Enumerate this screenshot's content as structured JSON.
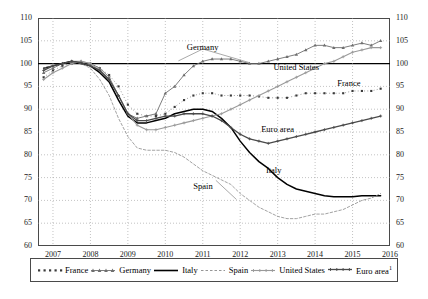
{
  "chart_data": {
    "type": "line",
    "title": "",
    "xlabel": "",
    "ylabel": "",
    "xlim": [
      2006.6,
      2016.0
    ],
    "ylim": [
      60,
      110
    ],
    "y_ticks": [
      60,
      65,
      70,
      75,
      80,
      85,
      90,
      95,
      100,
      105,
      110
    ],
    "x_ticks": [
      "2007",
      "2008",
      "2009",
      "2010",
      "2011",
      "2012",
      "2013",
      "2014",
      "2015",
      "2016"
    ],
    "grid": true,
    "legend_position": "bottom",
    "reference_line": 100,
    "series": [
      {
        "name": "France",
        "style": "dotted-markers",
        "x": [
          2006.75,
          2007.0,
          2007.25,
          2007.5,
          2007.75,
          2008.0,
          2008.25,
          2008.5,
          2008.75,
          2009.0,
          2009.25,
          2009.5,
          2009.75,
          2010.0,
          2010.25,
          2010.5,
          2010.75,
          2011.0,
          2011.25,
          2011.5,
          2011.75,
          2012.0,
          2012.25,
          2012.5,
          2012.75,
          2013.0,
          2013.25,
          2013.5,
          2013.75,
          2014.0,
          2014.25,
          2014.5,
          2014.75,
          2015.0,
          2015.25,
          2015.5,
          2015.75
        ],
        "values": [
          97.0,
          98.5,
          99.5,
          100.0,
          100.2,
          100.0,
          99.0,
          97.5,
          95.0,
          91.0,
          89.0,
          88.5,
          88.5,
          89.0,
          90.5,
          92.0,
          93.0,
          93.5,
          93.5,
          93.0,
          93.0,
          93.0,
          93.0,
          92.8,
          92.5,
          92.5,
          92.5,
          93.0,
          93.5,
          93.5,
          93.5,
          93.5,
          93.5,
          94.0,
          94.0,
          94.0,
          94.5
        ]
      },
      {
        "name": "Germany",
        "style": "triangle-markers",
        "x": [
          2006.75,
          2007.0,
          2007.25,
          2007.5,
          2007.75,
          2008.0,
          2008.25,
          2008.5,
          2008.75,
          2009.0,
          2009.25,
          2009.5,
          2009.75,
          2010.0,
          2010.25,
          2010.5,
          2010.75,
          2011.0,
          2011.25,
          2011.5,
          2011.75,
          2012.0,
          2012.25,
          2012.5,
          2012.75,
          2013.0,
          2013.25,
          2013.5,
          2013.75,
          2014.0,
          2014.25,
          2014.5,
          2014.75,
          2015.0,
          2015.25,
          2015.5,
          2015.75
        ],
        "values": [
          98.0,
          99.0,
          100.0,
          100.5,
          100.5,
          100.0,
          99.0,
          97.0,
          93.0,
          89.0,
          88.0,
          88.5,
          89.0,
          93.5,
          95.0,
          97.5,
          99.5,
          100.5,
          101.0,
          101.0,
          101.0,
          100.5,
          100.0,
          100.0,
          100.5,
          101.0,
          101.5,
          102.0,
          103.0,
          104.0,
          104.0,
          103.5,
          103.5,
          104.0,
          104.5,
          104.0,
          105.0
        ]
      },
      {
        "name": "Italy",
        "style": "solid-black",
        "x": [
          2006.75,
          2007.0,
          2007.25,
          2007.5,
          2007.75,
          2008.0,
          2008.25,
          2008.5,
          2008.75,
          2009.0,
          2009.25,
          2009.5,
          2009.75,
          2010.0,
          2010.25,
          2010.5,
          2010.75,
          2011.0,
          2011.25,
          2011.5,
          2011.75,
          2012.0,
          2012.25,
          2012.5,
          2012.75,
          2013.0,
          2013.25,
          2013.5,
          2013.75,
          2014.0,
          2014.25,
          2014.5,
          2014.75,
          2015.0,
          2015.25,
          2015.5,
          2015.75
        ],
        "values": [
          99.0,
          99.5,
          100.0,
          100.5,
          100.0,
          99.5,
          98.0,
          96.0,
          92.0,
          88.5,
          87.0,
          87.0,
          87.5,
          88.0,
          89.0,
          89.5,
          90.0,
          90.0,
          89.5,
          88.0,
          86.0,
          83.0,
          80.5,
          78.5,
          77.0,
          75.0,
          73.5,
          72.5,
          72.0,
          71.5,
          71.0,
          70.8,
          70.8,
          70.8,
          71.0,
          71.0,
          71.0
        ]
      },
      {
        "name": "Spain",
        "style": "dashed-fine",
        "x": [
          2006.75,
          2007.0,
          2007.25,
          2007.5,
          2007.75,
          2008.0,
          2008.25,
          2008.5,
          2008.75,
          2009.0,
          2009.25,
          2009.5,
          2009.75,
          2010.0,
          2010.25,
          2010.5,
          2010.75,
          2011.0,
          2011.25,
          2011.5,
          2011.75,
          2012.0,
          2012.25,
          2012.5,
          2012.75,
          2013.0,
          2013.25,
          2013.5,
          2013.75,
          2014.0,
          2014.25,
          2014.5,
          2014.75,
          2015.0,
          2015.25,
          2015.5,
          2015.75
        ],
        "values": [
          99.0,
          99.5,
          100.0,
          100.5,
          100.0,
          99.0,
          96.5,
          93.0,
          88.0,
          84.0,
          81.5,
          81.0,
          81.0,
          81.0,
          80.5,
          79.5,
          78.0,
          76.5,
          75.5,
          74.5,
          73.5,
          71.5,
          70.0,
          68.5,
          67.5,
          66.5,
          66.0,
          66.0,
          66.5,
          67.0,
          67.0,
          67.5,
          68.0,
          69.0,
          70.0,
          70.5,
          71.5
        ]
      },
      {
        "name": "United States",
        "style": "solid-gray-markers",
        "x": [
          2006.75,
          2007.0,
          2007.25,
          2007.5,
          2007.75,
          2008.0,
          2008.25,
          2008.5,
          2008.75,
          2009.0,
          2009.25,
          2009.5,
          2009.75,
          2010.0,
          2010.25,
          2010.5,
          2010.75,
          2011.0,
          2011.25,
          2011.5,
          2011.75,
          2012.0,
          2012.25,
          2012.5,
          2012.75,
          2013.0,
          2013.25,
          2013.5,
          2013.75,
          2014.0,
          2014.25,
          2014.5,
          2014.75,
          2015.0,
          2015.25,
          2015.5,
          2015.75
        ],
        "values": [
          96.5,
          98.0,
          99.0,
          100.0,
          100.5,
          100.0,
          98.5,
          96.5,
          93.0,
          89.0,
          86.5,
          85.5,
          85.5,
          86.0,
          86.5,
          87.0,
          87.5,
          88.0,
          88.5,
          89.0,
          90.0,
          91.0,
          92.0,
          93.0,
          94.0,
          95.0,
          96.0,
          97.0,
          98.0,
          99.0,
          100.0,
          100.5,
          101.5,
          102.5,
          103.0,
          103.5,
          103.5
        ]
      },
      {
        "name": "Euro area",
        "style": "solid-dark-markers",
        "x": [
          2006.75,
          2007.0,
          2007.25,
          2007.5,
          2007.75,
          2008.0,
          2008.25,
          2008.5,
          2008.75,
          2009.0,
          2009.25,
          2009.5,
          2009.75,
          2010.0,
          2010.25,
          2010.5,
          2010.75,
          2011.0,
          2011.25,
          2011.5,
          2011.75,
          2012.0,
          2012.25,
          2012.5,
          2012.75,
          2013.0,
          2013.25,
          2013.5,
          2013.75,
          2014.0,
          2014.25,
          2014.5,
          2014.75,
          2015.0,
          2015.25,
          2015.5,
          2015.75
        ],
        "values": [
          98.5,
          99.5,
          100.0,
          100.5,
          100.2,
          99.5,
          98.5,
          96.5,
          93.0,
          89.0,
          87.5,
          87.5,
          88.0,
          88.5,
          88.5,
          89.0,
          89.0,
          89.0,
          88.5,
          87.5,
          86.0,
          84.5,
          83.5,
          83.0,
          82.5,
          83.0,
          83.5,
          84.0,
          84.5,
          85.0,
          85.5,
          86.0,
          86.5,
          87.0,
          87.5,
          88.0,
          88.5
        ]
      }
    ],
    "annotations": [
      {
        "text": "Germany",
        "x": 2011.0,
        "y": 103.5
      },
      {
        "text": "United States",
        "x": 2013.5,
        "y": 99.0
      },
      {
        "text": "France",
        "x": 2014.9,
        "y": 95.5
      },
      {
        "text": "Euro area",
        "x": 2013.0,
        "y": 85.5
      },
      {
        "text": "Italy",
        "x": 2012.9,
        "y": 76.5
      },
      {
        "text": "Spain",
        "x": 2011.0,
        "y": 73.0
      }
    ]
  },
  "legend": {
    "items": [
      {
        "label": "France",
        "marker": "square-dotted"
      },
      {
        "label": "Germany",
        "marker": "triangle-line"
      },
      {
        "label": "Italy",
        "marker": "solid-black-line"
      },
      {
        "label": "Spain",
        "marker": "dashed-line"
      },
      {
        "label": "United States",
        "marker": "gray-cross-line"
      },
      {
        "label": "Euro area",
        "marker": "dark-cross-line",
        "superscript": "1"
      }
    ]
  }
}
